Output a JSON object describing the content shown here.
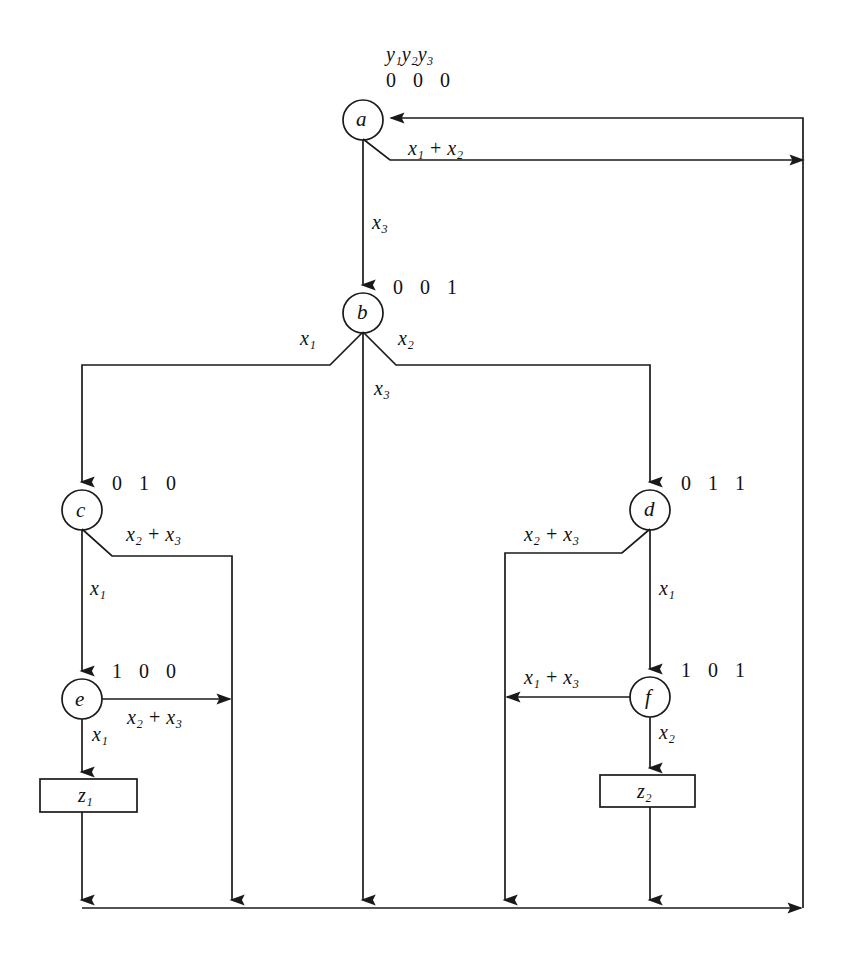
{
  "diagram": {
    "kind": "state-transition-diagram",
    "header": {
      "state_vars": "y1y2y3",
      "state_vars_display": "y₁y₂y₃",
      "initial_code": "0 0 0"
    },
    "stroke_color": "#1a1a1a",
    "background_color": "#ffffff",
    "states": [
      {
        "id": "a",
        "label": "a",
        "code": "0 0 0",
        "cx": 363,
        "cy": 120,
        "r": 20
      },
      {
        "id": "b",
        "label": "b",
        "code": "0 0 1",
        "cx": 363,
        "cy": 313,
        "r": 20
      },
      {
        "id": "c",
        "label": "c",
        "code": "0 1 0",
        "cx": 82,
        "cy": 510,
        "r": 20
      },
      {
        "id": "d",
        "label": "d",
        "code": "0 1 1",
        "cx": 650,
        "cy": 510,
        "r": 20
      },
      {
        "id": "e",
        "label": "e",
        "code": "1 0 0",
        "cx": 82,
        "cy": 699,
        "r": 20
      },
      {
        "id": "f",
        "label": "f",
        "code": "1 0 1",
        "cx": 650,
        "cy": 697,
        "r": 20
      }
    ],
    "outputs": [
      {
        "id": "z1",
        "label": "z₁",
        "x": 40,
        "y": 779,
        "w": 97,
        "h": 33
      },
      {
        "id": "z2",
        "label": "z₂",
        "x": 600,
        "y": 775,
        "w": 95,
        "h": 32
      }
    ],
    "transitions": [
      {
        "from": "a",
        "to": "b",
        "condition": "x₃",
        "label_x": 372,
        "label_y": 212
      },
      {
        "from": "a",
        "to": "return",
        "condition": "x₁ + x₂",
        "label_x": 408,
        "label_y": 138
      },
      {
        "from": "b",
        "to": "c",
        "condition": "x₁",
        "label_x": 300,
        "label_y": 328
      },
      {
        "from": "b",
        "to": "d",
        "condition": "x₂",
        "label_x": 398,
        "label_y": 328
      },
      {
        "from": "b",
        "to": "bottom",
        "condition": "x₃",
        "label_x": 374,
        "label_y": 378
      },
      {
        "from": "c",
        "to": "e",
        "condition": "x₁",
        "label_x": 90,
        "label_y": 578
      },
      {
        "from": "c",
        "to": "bus-c",
        "condition": "x₂ + x₃",
        "label_x": 126,
        "label_y": 524
      },
      {
        "from": "d",
        "to": "f",
        "condition": "x₁",
        "label_x": 659,
        "label_y": 578
      },
      {
        "from": "d",
        "to": "bus-d",
        "condition": "x₂ + x₃",
        "label_x": 524,
        "label_y": 524
      },
      {
        "from": "e",
        "to": "z1",
        "condition": "x₁",
        "label_x": 92,
        "label_y": 724
      },
      {
        "from": "e",
        "to": "bus-c",
        "condition": "x₂ + x₃",
        "label_x": 127,
        "label_y": 707
      },
      {
        "from": "f",
        "to": "z2",
        "condition": "x₂",
        "label_x": 659,
        "label_y": 722
      },
      {
        "from": "f",
        "to": "bus-d",
        "condition": "x₁ + x₃",
        "label_x": 524,
        "label_y": 667
      }
    ],
    "geometry": {
      "right_return_x": 803,
      "bottom_bus_y": 908,
      "left_bus_x": 82,
      "branch_c_x": 232,
      "branch_d_x": 505
    }
  }
}
